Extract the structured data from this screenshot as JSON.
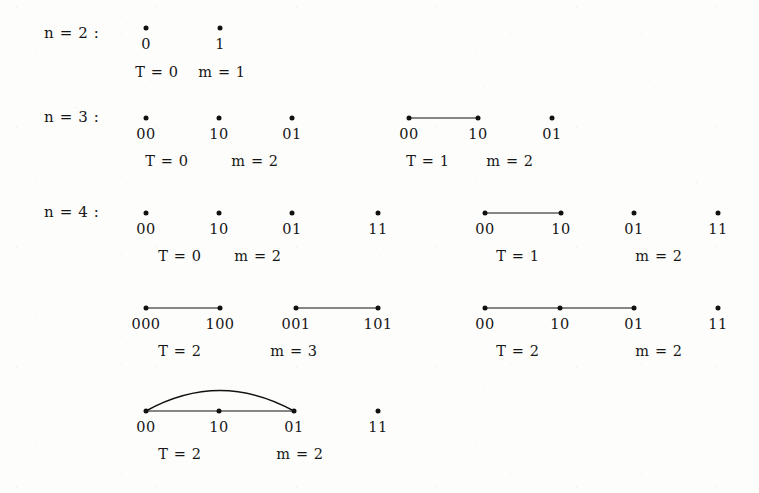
{
  "figure": {
    "kind": "graph-diagram",
    "ink_color": "#111111",
    "background_color": "#fdfdfc",
    "rows": [
      {
        "name": "row-n2",
        "label": "n = 2 :",
        "label_x": 44,
        "label_y": 33
      },
      {
        "name": "row-n3",
        "label": "n = 3 :",
        "label_x": 44,
        "label_y": 117
      },
      {
        "name": "row-n4",
        "label": "n = 4 :",
        "label_x": 44,
        "label_y": 212
      }
    ],
    "graphs": [
      {
        "name": "graph-n2-T0",
        "row": "n = 2",
        "vertices": [
          {
            "label": "0",
            "x": 146,
            "y": 28
          },
          {
            "label": "1",
            "x": 220,
            "y": 28
          }
        ],
        "edges": [],
        "arcs": [],
        "stats": [
          {
            "text": "T = 0",
            "x": 157,
            "y": 72
          },
          {
            "text": "m = 1",
            "x": 222,
            "y": 72
          }
        ]
      },
      {
        "name": "graph-n3-T0",
        "row": "n = 3",
        "vertices": [
          {
            "label": "00",
            "x": 146,
            "y": 118
          },
          {
            "label": "10",
            "x": 219,
            "y": 118
          },
          {
            "label": "01",
            "x": 292,
            "y": 118
          }
        ],
        "edges": [],
        "arcs": [],
        "stats": [
          {
            "text": "T = 0",
            "x": 167,
            "y": 161
          },
          {
            "text": "m = 2",
            "x": 255,
            "y": 161
          }
        ]
      },
      {
        "name": "graph-n3-T1",
        "row": "n = 3",
        "vertices": [
          {
            "label": "00",
            "x": 409,
            "y": 118
          },
          {
            "label": "10",
            "x": 478,
            "y": 118
          },
          {
            "label": "01",
            "x": 552,
            "y": 118
          }
        ],
        "edges": [
          {
            "from": 0,
            "to": 1
          }
        ],
        "arcs": [],
        "stats": [
          {
            "text": "T = 1",
            "x": 428,
            "y": 161
          },
          {
            "text": "m = 2",
            "x": 510,
            "y": 161
          }
        ]
      },
      {
        "name": "graph-n4-T0",
        "row": "n = 4",
        "vertices": [
          {
            "label": "00",
            "x": 146,
            "y": 213
          },
          {
            "label": "10",
            "x": 219,
            "y": 213
          },
          {
            "label": "01",
            "x": 292,
            "y": 213
          },
          {
            "label": "11",
            "x": 378,
            "y": 213
          }
        ],
        "edges": [],
        "arcs": [],
        "stats": [
          {
            "text": "T = 0",
            "x": 180,
            "y": 256
          },
          {
            "text": "m = 2",
            "x": 258,
            "y": 256
          }
        ]
      },
      {
        "name": "graph-n4-T1",
        "row": "n = 4",
        "vertices": [
          {
            "label": "00",
            "x": 485,
            "y": 213
          },
          {
            "label": "10",
            "x": 561,
            "y": 213
          },
          {
            "label": "01",
            "x": 634,
            "y": 213
          },
          {
            "label": "11",
            "x": 718,
            "y": 213
          }
        ],
        "edges": [
          {
            "from": 0,
            "to": 1
          }
        ],
        "arcs": [],
        "stats": [
          {
            "text": "T = 1",
            "x": 518,
            "y": 256
          },
          {
            "text": "m = 2",
            "x": 659,
            "y": 256
          }
        ]
      },
      {
        "name": "graph-n4-T2-a",
        "row": "n = 4",
        "vertices": [
          {
            "label": "000",
            "x": 146,
            "y": 308
          },
          {
            "label": "100",
            "x": 220,
            "y": 308
          },
          {
            "label": "001",
            "x": 296,
            "y": 308
          },
          {
            "label": "101",
            "x": 378,
            "y": 308
          }
        ],
        "edges": [
          {
            "from": 0,
            "to": 1
          },
          {
            "from": 2,
            "to": 3
          }
        ],
        "arcs": [],
        "stats": [
          {
            "text": "T = 2",
            "x": 180,
            "y": 351
          },
          {
            "text": "m = 3",
            "x": 294,
            "y": 351
          }
        ]
      },
      {
        "name": "graph-n4-T2-b",
        "row": "n = 4",
        "vertices": [
          {
            "label": "00",
            "x": 485,
            "y": 308
          },
          {
            "label": "10",
            "x": 560,
            "y": 308
          },
          {
            "label": "01",
            "x": 634,
            "y": 308
          },
          {
            "label": "11",
            "x": 718,
            "y": 308
          }
        ],
        "edges": [
          {
            "from": 0,
            "to": 1
          },
          {
            "from": 1,
            "to": 2
          }
        ],
        "arcs": [],
        "stats": [
          {
            "text": "T = 2",
            "x": 518,
            "y": 351
          },
          {
            "text": "m = 2",
            "x": 659,
            "y": 351
          }
        ]
      },
      {
        "name": "graph-n4-T2-c",
        "row": "n = 4",
        "vertices": [
          {
            "label": "00",
            "x": 146,
            "y": 411
          },
          {
            "label": "10",
            "x": 219,
            "y": 411
          },
          {
            "label": "01",
            "x": 294,
            "y": 411
          },
          {
            "label": "11",
            "x": 378,
            "y": 411
          }
        ],
        "edges": [
          {
            "from": 0,
            "to": 1
          },
          {
            "from": 1,
            "to": 2
          }
        ],
        "arcs": [
          {
            "from": 0,
            "to": 2,
            "height": 30
          }
        ],
        "stats": [
          {
            "text": "T = 2",
            "x": 180,
            "y": 454
          },
          {
            "text": "m = 2",
            "x": 300,
            "y": 454
          }
        ]
      }
    ]
  }
}
